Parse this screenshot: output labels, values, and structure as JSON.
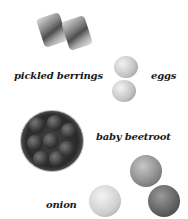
{
  "items": [
    {
      "label": "pickled berrings"
    },
    {
      "label": "eggs"
    },
    {
      "label": "baby beetroot"
    },
    {
      "label": "onion"
    }
  ],
  "colors": {
    "text": "#1a1a1a",
    "background": "#ffffff"
  }
}
